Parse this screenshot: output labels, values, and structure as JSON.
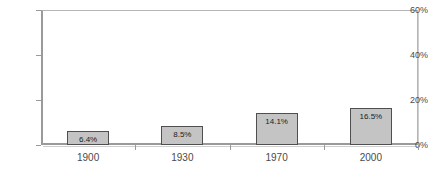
{
  "chart_data": {
    "type": "bar",
    "title": "",
    "xlabel": "",
    "ylabel": "",
    "categories": [
      "1900",
      "1930",
      "1970",
      "2000"
    ],
    "values": [
      6.4,
      8.5,
      14.1,
      16.5
    ],
    "value_labels": [
      "6.4%",
      "8.5%",
      "14.1%",
      "16.5%"
    ],
    "ylim": [
      0,
      60
    ],
    "yticks": [
      0,
      20,
      40,
      60
    ],
    "ytick_labels": [
      "0%",
      "20%",
      "40%",
      "60%"
    ],
    "grid": false,
    "legend": false,
    "bar_fill": "#c4c4c4",
    "bar_border": "#4f4f4f",
    "axis_color": "#9a9a9a",
    "plot_background": "#ffffff"
  }
}
